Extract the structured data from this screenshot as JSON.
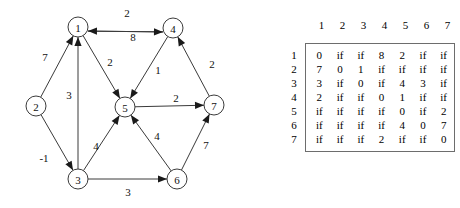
{
  "graph": {
    "title": "weighted directed graph",
    "infinity_token": "if",
    "nodes": [
      {
        "id": "1",
        "label": "1",
        "x": 78,
        "y": 27,
        "r": 10
      },
      {
        "id": "2",
        "label": "2",
        "x": 36,
        "y": 106,
        "r": 10
      },
      {
        "id": "3",
        "label": "3",
        "x": 78,
        "y": 179,
        "r": 10
      },
      {
        "id": "4",
        "label": "4",
        "x": 173,
        "y": 28,
        "r": 10
      },
      {
        "id": "5",
        "label": "5",
        "x": 125,
        "y": 107,
        "r": 10
      },
      {
        "id": "6",
        "label": "6",
        "x": 177,
        "y": 179,
        "r": 10
      },
      {
        "id": "7",
        "label": "7",
        "x": 214,
        "y": 105,
        "r": 10
      }
    ],
    "edges": [
      {
        "from": "4",
        "to": "1",
        "weight": "2",
        "label_x": 127,
        "label_y": 13
      },
      {
        "from": "1",
        "to": "4",
        "weight": "8",
        "label_x": 133,
        "label_y": 37
      },
      {
        "from": "2",
        "to": "1",
        "weight": "7",
        "label_x": 45,
        "label_y": 57
      },
      {
        "from": "3",
        "to": "1",
        "weight": "3",
        "label_x": 69,
        "label_y": 95
      },
      {
        "from": "1",
        "to": "5",
        "weight": "2",
        "label_x": 110,
        "label_y": 62
      },
      {
        "from": "4",
        "to": "5",
        "weight": "1",
        "label_x": 158,
        "label_y": 70
      },
      {
        "from": "7",
        "to": "4",
        "weight": "2",
        "label_x": 212,
        "label_y": 64
      },
      {
        "from": "5",
        "to": "7",
        "weight": "2",
        "label_x": 176,
        "label_y": 98
      },
      {
        "from": "2",
        "to": "3",
        "weight": "-1",
        "label_x": 44,
        "label_y": 158
      },
      {
        "from": "3",
        "to": "5",
        "weight": "4",
        "label_x": 96,
        "label_y": 146
      },
      {
        "from": "6",
        "to": "5",
        "weight": "4",
        "label_x": 157,
        "label_y": 136
      },
      {
        "from": "3",
        "to": "6",
        "weight": "3",
        "label_x": 128,
        "label_y": 192
      },
      {
        "from": "6",
        "to": "7",
        "weight": "7",
        "label_x": 206,
        "label_y": 145
      }
    ]
  },
  "matrix": {
    "col_headers": [
      "1",
      "2",
      "3",
      "4",
      "5",
      "6",
      "7"
    ],
    "row_headers": [
      "1",
      "2",
      "3",
      "4",
      "5",
      "6",
      "7"
    ],
    "rows": [
      [
        "0",
        "if",
        "if",
        "8",
        "2",
        "if",
        "if"
      ],
      [
        "7",
        "0",
        "1",
        "if",
        "if",
        "if",
        "if"
      ],
      [
        "3",
        "if",
        "0",
        "if",
        "4",
        "3",
        "if"
      ],
      [
        "2",
        "if",
        "if",
        "0",
        "1",
        "if",
        "if"
      ],
      [
        "if",
        "if",
        "if",
        "if",
        "0",
        "if",
        "2"
      ],
      [
        "if",
        "if",
        "if",
        "if",
        "4",
        "0",
        "7"
      ],
      [
        "if",
        "if",
        "if",
        "2",
        "if",
        "if",
        "0"
      ]
    ]
  },
  "colors": {
    "background": "#ffffff",
    "ink": "#111111",
    "stroke": "#3a3a3a",
    "matrix_border": "#6d6d6d"
  }
}
